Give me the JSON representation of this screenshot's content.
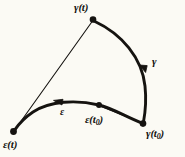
{
  "figure": {
    "background_color": "#fbfaf4",
    "ink_color": "#151310",
    "labels": {
      "gamma_t": "γ(t)",
      "gamma": "γ",
      "gamma_t0_main": "γ(t",
      "gamma_t0_sub": "0",
      "gamma_t0_close": ")",
      "epsilon_t0_main": "ε(t",
      "epsilon_t0_sub": "0",
      "epsilon_t0_close": ")",
      "epsilon": "ε",
      "epsilon_t": "ε(t)"
    },
    "points": [
      {
        "name": "gamma-t-point",
        "label": "γ(t)",
        "x": 93,
        "y": 19
      },
      {
        "name": "gamma-t0-point",
        "label": "γ(t0)",
        "x": 143,
        "y": 124
      },
      {
        "name": "epsilon-t0-point",
        "label": "ε(t0)",
        "x": 99,
        "y": 105
      },
      {
        "name": "epsilon-t-point",
        "label": "ε(t)",
        "x": 13,
        "y": 132
      }
    ],
    "curves": [
      {
        "name": "gamma-curve",
        "style": "thick",
        "from": "γ(t)",
        "to": "γ(t0)"
      },
      {
        "name": "epsilon-curve",
        "style": "thick",
        "from": "γ(t0)",
        "to": "ε(t)"
      },
      {
        "name": "chord-gamma-epsilon",
        "style": "thin",
        "from": "γ(t)",
        "to": "ε(t)"
      },
      {
        "name": "chord-t0",
        "style": "thin",
        "from": "γ(t0)",
        "to": "ε(t0)"
      }
    ],
    "arrows": [
      {
        "name": "gamma-direction-arrow",
        "along": "gamma-curve",
        "direction": "downward"
      },
      {
        "name": "epsilon-direction-arrow",
        "along": "epsilon-curve",
        "direction": "leftward"
      }
    ]
  }
}
